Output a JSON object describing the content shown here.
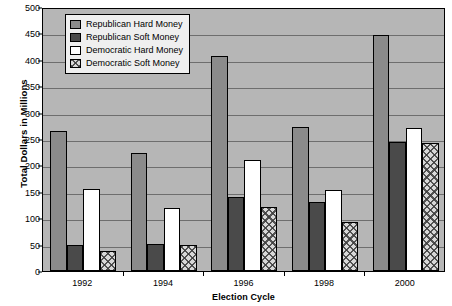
{
  "chart_data": {
    "type": "bar",
    "title": "",
    "xlabel": "Election Cycle",
    "ylabel": "Total Dollars in Millions",
    "categories": [
      "1992",
      "1994",
      "1996",
      "1998",
      "2000"
    ],
    "ylim": [
      0,
      500
    ],
    "ytick_step": 50,
    "yticks": [
      0,
      50,
      100,
      150,
      200,
      250,
      300,
      350,
      400,
      450,
      500
    ],
    "grid": true,
    "legend_position": "top-left-inside",
    "series": [
      {
        "name": "Republican Hard Money",
        "color": "#8b8b8b",
        "pattern": "solid",
        "values": [
          265,
          224,
          408,
          273,
          447
        ]
      },
      {
        "name": "Republican Soft Money",
        "color": "#4a4a4a",
        "pattern": "solid",
        "values": [
          50,
          52,
          141,
          131,
          245
        ]
      },
      {
        "name": "Democratic Hard Money",
        "color": "#ffffff",
        "pattern": "solid",
        "values": [
          155,
          120,
          210,
          153,
          270
        ]
      },
      {
        "name": "Democratic Soft Money",
        "color": "#d8d8d8",
        "pattern": "cross-hatch",
        "values": [
          37,
          49,
          122,
          92,
          242
        ]
      }
    ]
  },
  "colors": {
    "plot_background": "#b6b6b6",
    "gridline": "#6e6e6e",
    "axis": "#000000",
    "legend_background": "#efefef",
    "page_background": "#ffffff"
  }
}
